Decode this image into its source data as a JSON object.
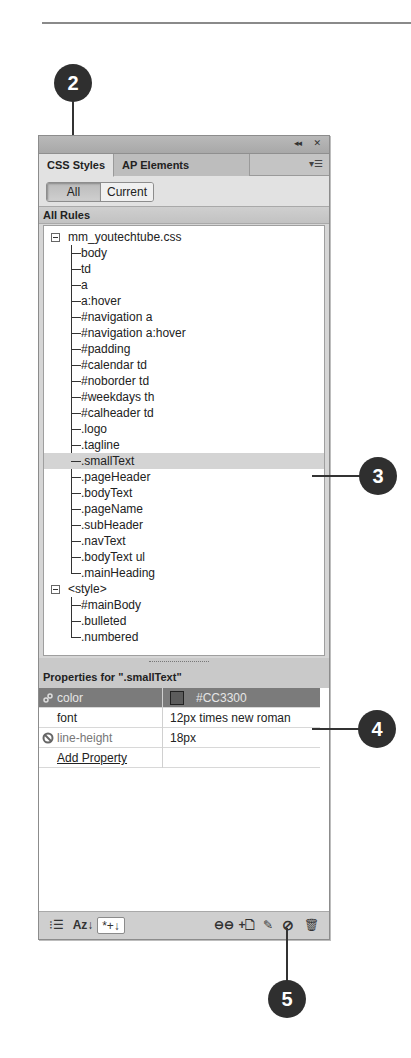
{
  "panel": {
    "title_controls": {
      "collapse": "◂◂",
      "close": "✕"
    },
    "tabs": [
      {
        "label": "CSS Styles",
        "active": true
      },
      {
        "label": "AP Elements",
        "active": false
      }
    ],
    "panel_menu_icon": "▾☰",
    "view_toggle": {
      "all": "All",
      "current": "Current",
      "selected": "All"
    },
    "rules_header": "All Rules",
    "rules_tree": [
      {
        "label": "mm_youtechtube.css",
        "expanded": true,
        "children": [
          "body",
          "td",
          "a",
          "a:hover",
          "#navigation a",
          "#navigation a:hover",
          "#padding",
          "#calendar td",
          "#noborder td",
          "#weekdays th",
          "#calheader td",
          ".logo",
          ".tagline",
          ".smallText",
          ".pageHeader",
          ".bodyText",
          ".pageName",
          ".subHeader",
          ".navText",
          ".bodyText ul",
          ".mainHeading"
        ]
      },
      {
        "label": "<style>",
        "expanded": true,
        "children": [
          "#mainBody",
          ".bulleted",
          ".numbered"
        ]
      }
    ],
    "selected_rule": ".smallText",
    "properties_header": "Properties for \".smallText\"",
    "properties": [
      {
        "name": "color",
        "value": "#CC3300",
        "swatch": true,
        "selected": true,
        "icon": "link-icon"
      },
      {
        "name": "font",
        "value": "12px times new roman",
        "swatch": false,
        "selected": false,
        "icon": ""
      },
      {
        "name": "line-height",
        "value": "18px",
        "swatch": false,
        "selected": false,
        "icon": "disabled-icon"
      }
    ],
    "add_property_label": "Add Property",
    "footer_left": {
      "category_view": "⁝☰",
      "alpha_view": "Az↓",
      "set_only": "*+↓"
    },
    "footer_right": {
      "attach": "⊖⊖",
      "new_rule": "+🗋",
      "edit": "✎",
      "disable": "⊘",
      "delete": "🗑"
    }
  },
  "callouts": [
    {
      "number": "2",
      "target": "CSS Styles tab"
    },
    {
      "number": "3",
      "target": ".smallText rule"
    },
    {
      "number": "4",
      "target": "color property"
    },
    {
      "number": "5",
      "target": "Disable/Enable CSS property button"
    }
  ],
  "colors": {
    "panel_bg": "#d6d6d6",
    "selected_rule_bg": "#d4d4d4",
    "selected_prop_bg": "#7b7b7b",
    "callout_bg": "#2f2f2f"
  }
}
